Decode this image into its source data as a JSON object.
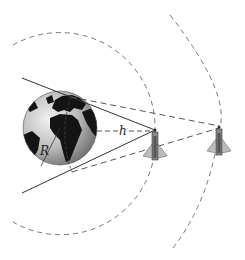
{
  "diagram": {
    "type": "satellite-earth-coverage",
    "labels": {
      "radius": "R",
      "altitude": "h"
    },
    "elements": {
      "earth": "globe showing Europe and Africa",
      "satellites": [
        "satellite-near",
        "satellite-far"
      ],
      "orbits": [
        "inner-orbit-arc",
        "outer-orbit-arc"
      ],
      "lines": [
        "tangent-lines-solid",
        "tangent-lines-dashed",
        "altitude-line-dashed",
        "radius-line"
      ]
    },
    "colors": {
      "line": "#333333",
      "dash": "#666666",
      "ocean_light": "#e6e6e6",
      "ocean_dark": "#8a8a8a",
      "land": "#111111"
    }
  }
}
